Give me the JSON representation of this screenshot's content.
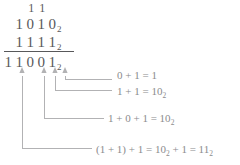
{
  "figure": {
    "colors": {
      "digit_text": "#58585a",
      "annotation_text": "#8b8b8d",
      "leader_line": "#b2b2b4",
      "rule_line": "#58585a",
      "background": "#ffffff"
    }
  },
  "sum": {
    "carry_row": {
      "label": "carry row",
      "digits": [
        "",
        "1",
        "1",
        "",
        ""
      ]
    },
    "addend_1": {
      "label": "first addend",
      "digits": [
        "1",
        "0",
        "1",
        "0"
      ],
      "subscript": "2",
      "value": "1010"
    },
    "addend_2": {
      "label": "second addend",
      "digits": [
        "1",
        "1",
        "1",
        "1"
      ],
      "subscript": "2",
      "value": "1111"
    },
    "total": {
      "label": "sum",
      "digits": [
        "1",
        "1",
        "0",
        "0",
        "1"
      ],
      "subscript": "2",
      "value": "11001"
    }
  },
  "annotations": [
    {
      "id": "col-1",
      "text": "0 + 1 = 1",
      "subscript": ""
    },
    {
      "id": "col-2",
      "text": "1 + 1 = 10",
      "subscript": "2"
    },
    {
      "id": "col-3",
      "text": "1 + 0 + 1 = 10",
      "subscript": "2"
    },
    {
      "id": "col-4",
      "text": "(1 + 1) + 1 = 10",
      "subscript": "2",
      "text_tail": " + 1 = 11",
      "subscript_tail": "2"
    }
  ]
}
